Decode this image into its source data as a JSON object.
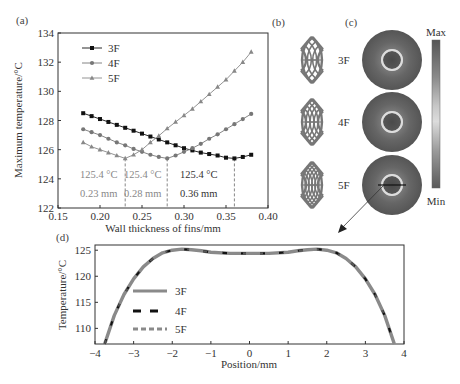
{
  "panels": {
    "a": {
      "label": "(a)"
    },
    "b": {
      "label": "(b)",
      "designs": [
        "3F",
        "4F",
        "5F"
      ]
    },
    "c": {
      "label": "(c)",
      "colorbar_max": "Max",
      "colorbar_min": "Min"
    },
    "d": {
      "label": "(d)"
    }
  },
  "chart_data": [
    {
      "id": "a",
      "type": "line",
      "title": "",
      "xlabel": "Wall thickness of fins/mm",
      "ylabel": "Maximum temperature/°C",
      "xlim": [
        0.15,
        0.4
      ],
      "ylim": [
        122,
        134
      ],
      "xticks": [
        "0.15",
        "0.20",
        "0.25",
        "0.30",
        "0.35",
        "0.40"
      ],
      "yticks": [
        "122",
        "124",
        "126",
        "128",
        "130",
        "132",
        "134"
      ],
      "grid": false,
      "legend_position": "upper left",
      "x": [
        0.18,
        0.19,
        0.2,
        0.21,
        0.22,
        0.23,
        0.24,
        0.25,
        0.26,
        0.27,
        0.28,
        0.29,
        0.3,
        0.31,
        0.32,
        0.33,
        0.34,
        0.35,
        0.36,
        0.37,
        0.38
      ],
      "series": [
        {
          "name": "3F",
          "marker": "square",
          "color": "#111111",
          "values": [
            128.5,
            128.3,
            128.1,
            127.9,
            127.7,
            127.5,
            127.3,
            127.1,
            126.9,
            126.7,
            126.5,
            126.3,
            126.1,
            125.95,
            125.8,
            125.7,
            125.6,
            125.45,
            125.4,
            125.5,
            125.65
          ]
        },
        {
          "name": "4F",
          "marker": "circle",
          "color": "#777777",
          "values": [
            127.4,
            127.2,
            127.0,
            126.75,
            126.5,
            126.3,
            126.05,
            125.85,
            125.65,
            125.5,
            125.4,
            125.6,
            125.85,
            126.1,
            126.4,
            126.75,
            127.05,
            127.4,
            127.75,
            128.1,
            128.45
          ]
        },
        {
          "name": "5F",
          "marker": "triangle",
          "color": "#888888",
          "values": [
            126.5,
            126.2,
            126.0,
            125.8,
            125.6,
            125.4,
            125.65,
            126.0,
            126.5,
            126.95,
            127.45,
            127.9,
            128.35,
            128.8,
            129.3,
            129.8,
            130.3,
            130.8,
            131.4,
            132.0,
            132.7
          ]
        }
      ],
      "annotations": [
        {
          "temp": "125.4 °C",
          "thickness": "0.23 mm",
          "x": 0.23
        },
        {
          "temp": "125.4 °C",
          "thickness": "0.28 mm",
          "x": 0.28
        },
        {
          "temp": "125.4 °C",
          "thickness": "0.36 mm",
          "x": 0.36
        }
      ]
    },
    {
      "id": "d",
      "type": "line",
      "title": "",
      "xlabel": "Position/mm",
      "ylabel": "Temperature/°C",
      "xlim": [
        -4,
        4
      ],
      "ylim": [
        107,
        126
      ],
      "xticks": [
        "−4",
        "−3",
        "−2",
        "−1",
        "0",
        "1",
        "2",
        "3",
        "4"
      ],
      "yticks": [
        "110",
        "115",
        "120",
        "125"
      ],
      "grid": false,
      "legend_position": "lower left",
      "x": [
        -3.75,
        -3.5,
        -3.25,
        -3.0,
        -2.75,
        -2.5,
        -2.25,
        -2.0,
        -1.75,
        -1.5,
        -1.25,
        -1.0,
        -0.5,
        0.0,
        0.5,
        1.0,
        1.25,
        1.5,
        1.75,
        2.0,
        2.25,
        2.5,
        2.75,
        3.0,
        3.25,
        3.5,
        3.75
      ],
      "series": [
        {
          "name": "3F",
          "style": "solid",
          "color": "#888888",
          "values": [
            107.0,
            112.5,
            116.5,
            119.5,
            121.8,
            123.4,
            124.5,
            125.0,
            125.2,
            125.1,
            124.9,
            124.6,
            124.4,
            124.4,
            124.4,
            124.6,
            124.9,
            125.1,
            125.2,
            125.0,
            124.5,
            123.4,
            121.8,
            119.5,
            116.5,
            112.5,
            107.0
          ]
        },
        {
          "name": "4F",
          "style": "dashed",
          "color": "#111111",
          "values": [
            107.0,
            112.5,
            116.5,
            119.5,
            121.8,
            123.4,
            124.5,
            125.0,
            125.2,
            125.1,
            124.9,
            124.6,
            124.4,
            124.4,
            124.4,
            124.6,
            124.9,
            125.1,
            125.2,
            125.0,
            124.5,
            123.4,
            121.8,
            119.5,
            116.5,
            112.5,
            107.0
          ]
        },
        {
          "name": "5F",
          "style": "dashed",
          "color": "#888888",
          "values": [
            107.0,
            112.5,
            116.5,
            119.5,
            121.8,
            123.4,
            124.5,
            125.0,
            125.2,
            125.1,
            124.9,
            124.6,
            124.4,
            124.4,
            124.4,
            124.6,
            124.9,
            125.1,
            125.2,
            125.0,
            124.5,
            123.4,
            121.8,
            119.5,
            116.5,
            112.5,
            107.0
          ]
        }
      ]
    }
  ]
}
